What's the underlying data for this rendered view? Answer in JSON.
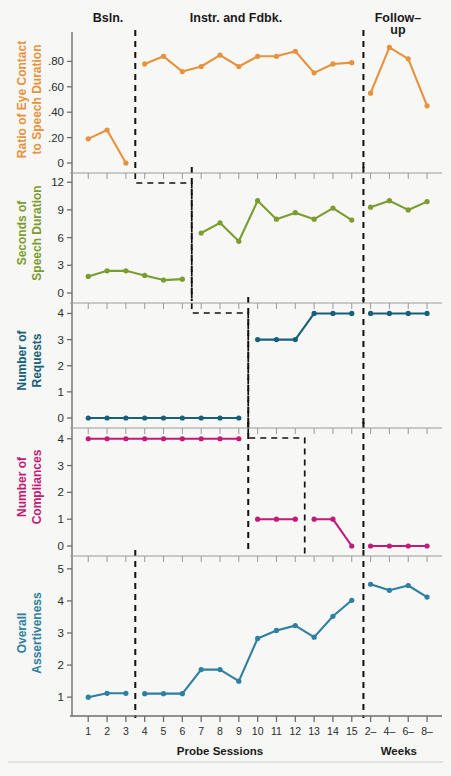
{
  "figure": {
    "background": "#f7f7f5",
    "phase_labels": [
      {
        "text": "Bsln.",
        "x": 108
      },
      {
        "text": "Instr. and Fdbk.",
        "x": 236
      },
      {
        "text": "Follow–",
        "x": 398
      },
      {
        "text": "up",
        "x": 398
      }
    ],
    "xaxis_title": "Probe Sessions",
    "xaxis_title2": "Weeks",
    "x_ticks": [
      "1",
      "2",
      "3",
      "4",
      "5",
      "6",
      "7",
      "8",
      "9",
      "10",
      "11",
      "12",
      "13",
      "14",
      "15",
      "2–",
      "4–",
      "6–",
      "8–"
    ]
  },
  "chart_data": [
    {
      "type": "line",
      "panel": 1,
      "title": "",
      "ylabel": "Ratio of Eye Contact\nto Speech Duration",
      "ylabel_line1": "Ratio of Eye Contact",
      "ylabel_line2": "to Speech Duration",
      "color": "#E8923C",
      "xlabel": "Probe Sessions",
      "ylim": [
        0,
        1.0
      ],
      "yticks": [
        0,
        0.2,
        0.4,
        0.6,
        0.8
      ],
      "ytick_labels": [
        "0",
        ".20",
        ".40",
        ".60",
        ".80"
      ],
      "grid": false,
      "segments": [
        {
          "phase": "Baseline",
          "x": [
            1,
            2,
            3
          ],
          "y": [
            0.19,
            0.26,
            0.0
          ]
        },
        {
          "phase": "Instr. and Fdbk.",
          "x": [
            4,
            5,
            6,
            7,
            8,
            9,
            10,
            11,
            12,
            13,
            14,
            15
          ],
          "y": [
            0.78,
            0.84,
            0.72,
            0.76,
            0.85,
            0.76,
            0.84,
            0.84,
            0.88,
            0.71,
            0.78,
            0.79
          ]
        },
        {
          "phase": "Follow-up",
          "x": [
            16,
            17,
            18,
            19
          ],
          "y": [
            0.55,
            0.91,
            0.82,
            0.45
          ]
        }
      ]
    },
    {
      "type": "line",
      "panel": 2,
      "ylabel_line1": "Seconds of",
      "ylabel_line2": "Speech Duration",
      "color": "#7B9C2F",
      "ylim": [
        0,
        13
      ],
      "yticks": [
        0,
        3,
        6,
        9,
        12
      ],
      "ytick_labels": [
        "0",
        "3",
        "6",
        "9",
        "12"
      ],
      "grid": false,
      "segments": [
        {
          "phase": "Baseline",
          "x": [
            1,
            2,
            3,
            4,
            5,
            6
          ],
          "y": [
            1.8,
            2.4,
            2.4,
            1.9,
            1.4,
            1.5
          ]
        },
        {
          "phase": "Instr. and Fdbk.",
          "x": [
            7,
            8,
            9,
            10,
            11,
            12,
            13,
            14,
            15
          ],
          "y": [
            6.5,
            7.6,
            5.6,
            10.0,
            8.0,
            8.7,
            8.0,
            9.2,
            7.9
          ]
        },
        {
          "phase": "Follow-up",
          "x": [
            16,
            17,
            18,
            19
          ],
          "y": [
            9.3,
            10.0,
            9.0,
            9.9
          ]
        }
      ]
    },
    {
      "type": "line",
      "panel": 3,
      "ylabel_line1": "Number of",
      "ylabel_line2": "Requests",
      "color": "#15607A",
      "ylim": [
        0,
        4.4
      ],
      "yticks": [
        0,
        1,
        2,
        3,
        4
      ],
      "ytick_labels": [
        "0",
        "1",
        "2",
        "3",
        "4"
      ],
      "grid": false,
      "segments": [
        {
          "phase": "Baseline",
          "x": [
            1,
            2,
            3,
            4,
            5,
            6,
            7,
            8,
            9
          ],
          "y": [
            0,
            0,
            0,
            0,
            0,
            0,
            0,
            0,
            0
          ]
        },
        {
          "phase": "Instr. and Fdbk.",
          "x": [
            10,
            11,
            12,
            13,
            14,
            15
          ],
          "y": [
            3,
            3,
            3,
            4,
            4,
            4
          ]
        },
        {
          "phase": "Follow-up",
          "x": [
            16,
            17,
            18,
            19
          ],
          "y": [
            4,
            4,
            4,
            4
          ]
        }
      ]
    },
    {
      "type": "line",
      "panel": 4,
      "ylabel_line1": "Number of",
      "ylabel_line2": "Compliances",
      "color": "#C41A77",
      "ylim": [
        0,
        4.4
      ],
      "yticks": [
        0,
        1,
        2,
        3,
        4
      ],
      "ytick_labels": [
        "0",
        "1",
        "2",
        "3",
        "4"
      ],
      "grid": false,
      "segments": [
        {
          "phase": "Baseline",
          "x": [
            1,
            2,
            3,
            4,
            5,
            6,
            7,
            8,
            9
          ],
          "y": [
            4,
            4,
            4,
            4,
            4,
            4,
            4,
            4,
            4
          ]
        },
        {
          "phase": "Instr. and Fdbk. a",
          "x": [
            10,
            11,
            12
          ],
          "y": [
            1,
            1,
            1
          ]
        },
        {
          "phase": "Instr. and Fdbk. b",
          "x": [
            13,
            14,
            15
          ],
          "y": [
            1,
            1,
            0
          ]
        },
        {
          "phase": "Follow-up",
          "x": [
            16,
            17,
            18,
            19
          ],
          "y": [
            0,
            0,
            0,
            0
          ]
        }
      ]
    },
    {
      "type": "line",
      "panel": 5,
      "ylabel_line1": "Overall",
      "ylabel_line2": "Assertiveness",
      "color": "#2E7FA0",
      "ylim": [
        0.6,
        5.4
      ],
      "yticks": [
        1,
        2,
        3,
        4,
        5
      ],
      "ytick_labels": [
        "1",
        "2",
        "3",
        "4",
        "5"
      ],
      "grid": false,
      "segments": [
        {
          "phase": "Baseline",
          "x": [
            1,
            2,
            3
          ],
          "y": [
            1.0,
            1.12,
            1.12
          ]
        },
        {
          "phase": "Instr. and Fdbk.",
          "x": [
            4,
            5,
            6,
            7,
            8,
            9,
            10,
            11,
            12,
            13,
            14,
            15
          ],
          "y": [
            1.11,
            1.11,
            1.11,
            1.86,
            1.86,
            1.5,
            2.83,
            3.08,
            3.23,
            2.87,
            3.52,
            4.02
          ]
        },
        {
          "phase": "Follow-up",
          "x": [
            16,
            17,
            18,
            19
          ],
          "y": [
            4.52,
            4.33,
            4.48,
            4.12
          ]
        }
      ]
    }
  ]
}
